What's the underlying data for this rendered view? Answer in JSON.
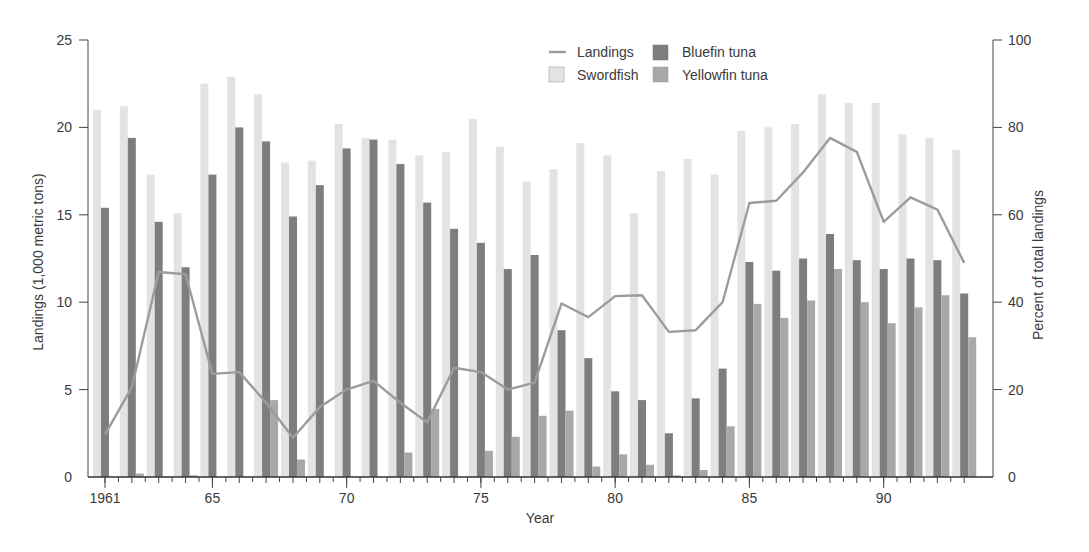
{
  "caption_fragment": "",
  "chart_data": {
    "type": "bar",
    "title": "",
    "xlabel": "Year",
    "ylabel": "Landings (1,000 metric tons)",
    "y2label": "Percent of total landings",
    "ylim": [
      0,
      25
    ],
    "y2lim": [
      0,
      100
    ],
    "yticks": [
      0,
      5,
      10,
      15,
      20,
      25
    ],
    "y2ticks": [
      0,
      20,
      40,
      60,
      80,
      100
    ],
    "xtick_labels": [
      {
        "year": 1961,
        "label": "1961"
      },
      {
        "year": 1965,
        "label": "65"
      },
      {
        "year": 1970,
        "label": "70"
      },
      {
        "year": 1975,
        "label": "75"
      },
      {
        "year": 1980,
        "label": "80"
      },
      {
        "year": 1985,
        "label": "85"
      },
      {
        "year": 1990,
        "label": "90"
      }
    ],
    "grid": false,
    "legend_position": "top-center-right",
    "categories": [
      1961,
      1962,
      1963,
      1964,
      1965,
      1966,
      1967,
      1968,
      1969,
      1970,
      1971,
      1972,
      1973,
      1974,
      1975,
      1976,
      1977,
      1978,
      1979,
      1980,
      1981,
      1982,
      1983,
      1984,
      1985,
      1986,
      1987,
      1988,
      1989,
      1990,
      1991,
      1992,
      1993
    ],
    "series": [
      {
        "name": "Swordfish",
        "kind": "bar",
        "axis": "left",
        "color": "#e3e3e3",
        "values": [
          21.0,
          21.2,
          17.3,
          15.1,
          22.5,
          22.9,
          21.9,
          18.0,
          18.1,
          20.2,
          19.4,
          19.3,
          18.4,
          18.6,
          20.5,
          18.9,
          16.9,
          17.6,
          19.1,
          18.4,
          15.1,
          17.5,
          18.2,
          17.3,
          19.8,
          20.0,
          20.2,
          21.9,
          21.4,
          21.4,
          19.6,
          19.4,
          18.7
        ]
      },
      {
        "name": "Bluefin tuna",
        "kind": "bar",
        "axis": "left",
        "color": "#7e7e7e",
        "values": [
          15.4,
          19.4,
          14.6,
          12.0,
          17.3,
          20.0,
          19.2,
          14.9,
          16.7,
          18.8,
          19.3,
          17.9,
          15.7,
          14.2,
          13.4,
          11.9,
          12.7,
          8.4,
          6.8,
          4.9,
          4.4,
          2.5,
          4.5,
          6.2,
          12.3,
          11.8,
          12.5,
          13.9,
          12.4,
          11.9,
          12.5,
          12.4,
          10.5
        ]
      },
      {
        "name": "Yellowfin tuna",
        "kind": "bar",
        "axis": "left",
        "color": "#a8a8a8",
        "values": [
          0.0,
          0.2,
          0.0,
          0.1,
          0.0,
          0.0,
          4.4,
          1.0,
          0.0,
          0.0,
          0.0,
          1.4,
          3.9,
          0.0,
          1.5,
          2.3,
          3.5,
          3.8,
          0.6,
          1.3,
          0.7,
          0.1,
          0.4,
          2.9,
          9.9,
          9.1,
          10.1,
          11.9,
          10.0,
          8.8,
          9.7,
          10.4,
          8.0
        ]
      },
      {
        "name": "Landings",
        "kind": "line",
        "axis": "right",
        "color": "#9c9c9c",
        "values": [
          9.7,
          20.5,
          46.9,
          46.4,
          23.6,
          24.0,
          17.0,
          9.0,
          16.0,
          20.0,
          22.0,
          17.0,
          12.5,
          25.0,
          24.0,
          20.0,
          21.6,
          39.7,
          36.6,
          41.4,
          41.6,
          33.2,
          33.6,
          40.0,
          62.7,
          63.2,
          69.7,
          77.6,
          74.4,
          58.4,
          64.0,
          61.2,
          49.0
        ]
      }
    ]
  },
  "legend": {
    "items": [
      {
        "label": "Landings",
        "swatch": "line"
      },
      {
        "label": "Bluefin tuna",
        "swatch": "box"
      },
      {
        "label": "Swordfish",
        "swatch": "box"
      },
      {
        "label": "Yellowfin tuna",
        "swatch": "box"
      }
    ]
  }
}
